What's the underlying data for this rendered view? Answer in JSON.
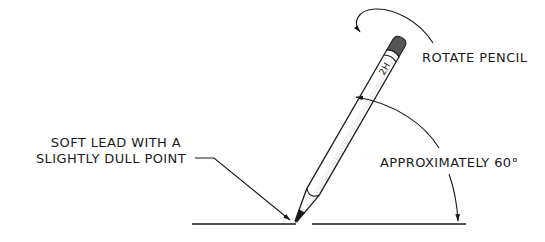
{
  "diagram": {
    "labels": {
      "rotate": "ROTATE PENCIL",
      "angle": "APPROXIMATELY 60°",
      "lead_line1": "SOFT LEAD WITH A",
      "lead_line2": "SLIGHTLY DULL POINT"
    },
    "pencil": {
      "grade": "2H",
      "angle_degrees": 60
    },
    "colors": {
      "line": "#1a1a1a",
      "eraser": "#555555",
      "background": "#ffffff"
    }
  }
}
